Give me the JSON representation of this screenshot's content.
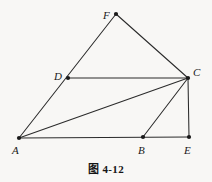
{
  "figure": {
    "caption_prefix": "图",
    "caption_number": "4-12",
    "caption_full": "图 4-12",
    "background_color": "#f8f7f5",
    "stroke_color": "#2b2b2b",
    "label_color": "#1a1a1a",
    "canvas": {
      "width": 212,
      "height": 182
    }
  },
  "points": [
    {
      "id": "F",
      "label": "F",
      "x": 116,
      "y": 14,
      "label_x": 103,
      "label_y": 10
    },
    {
      "id": "C",
      "label": "C",
      "x": 188,
      "y": 78,
      "label_x": 193,
      "label_y": 67
    },
    {
      "id": "D",
      "label": "D",
      "x": 68,
      "y": 78,
      "label_x": 54,
      "label_y": 71
    },
    {
      "id": "A",
      "label": "A",
      "x": 19,
      "y": 138,
      "label_x": 12,
      "label_y": 145
    },
    {
      "id": "B",
      "label": "B",
      "x": 143,
      "y": 137,
      "label_x": 138,
      "label_y": 145
    },
    {
      "id": "E",
      "label": "E",
      "x": 189,
      "y": 137,
      "label_x": 184,
      "label_y": 145
    }
  ],
  "segments": [
    {
      "id": "A-F",
      "from": "A",
      "to": "F",
      "description": "line from A through D up to F"
    },
    {
      "id": "F-C",
      "from": "F",
      "to": "C",
      "description": "line from F down to C"
    },
    {
      "id": "D-C",
      "from": "D",
      "to": "C",
      "description": "horizontal line D to C"
    },
    {
      "id": "A-C",
      "from": "A",
      "to": "C",
      "description": "diagonal line A to C"
    },
    {
      "id": "A-E",
      "from": "A",
      "to": "E",
      "description": "horizontal baseline A through B to E"
    },
    {
      "id": "B-C",
      "from": "B",
      "to": "C",
      "description": "line B up to C"
    },
    {
      "id": "C-E",
      "from": "C",
      "to": "E",
      "description": "vertical line C down to E"
    }
  ]
}
